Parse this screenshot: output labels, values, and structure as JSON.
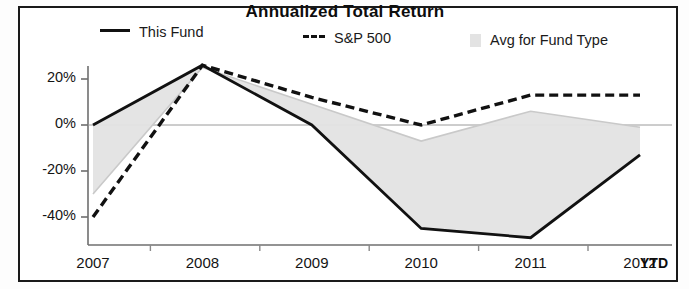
{
  "chart": {
    "title": "Annualized Total Return",
    "legend": [
      {
        "key": "this_fund",
        "label": "This Fund",
        "marker": "solid-line-swatch",
        "color": "#111111"
      },
      {
        "key": "sp500",
        "label": "S&P 500",
        "prefix": "---",
        "marker": "dashed-line-swatch",
        "color": "#111111"
      },
      {
        "key": "avg_fund_type",
        "label": "Avg for Fund Type",
        "marker": "gray-box-swatch",
        "color": "#e3e3e3"
      }
    ],
    "ytd_note": "YTD"
  },
  "chart_data": {
    "type": "line",
    "title": "Annualized Total Return",
    "xlabel": "",
    "ylabel": "",
    "categories": [
      "2007",
      "2008",
      "2009",
      "2010",
      "2011",
      "2012"
    ],
    "x_tick_labels": [
      "2007",
      "2008",
      "2009",
      "2010",
      "2011",
      "2012"
    ],
    "y_tick_labels": [
      "20%",
      "0%",
      "-20%",
      "-40%"
    ],
    "y_ticks": [
      20,
      0,
      -20,
      -40
    ],
    "ylim": [
      -52,
      30
    ],
    "grid": false,
    "legend_position": "top",
    "series": [
      {
        "name": "This Fund",
        "style": "solid",
        "color": "#111111",
        "values": [
          0,
          26,
          0,
          -45,
          -49,
          -13
        ]
      },
      {
        "name": "S&P 500",
        "style": "dashed",
        "color": "#111111",
        "values": [
          -40,
          26,
          12,
          0,
          13,
          13
        ]
      },
      {
        "name": "Avg for Fund Type",
        "style": "filled-area",
        "color": "#e3e3e3",
        "values": [
          -30,
          25,
          9,
          -7,
          6,
          -1
        ]
      }
    ],
    "annotations": [
      "YTD"
    ]
  }
}
